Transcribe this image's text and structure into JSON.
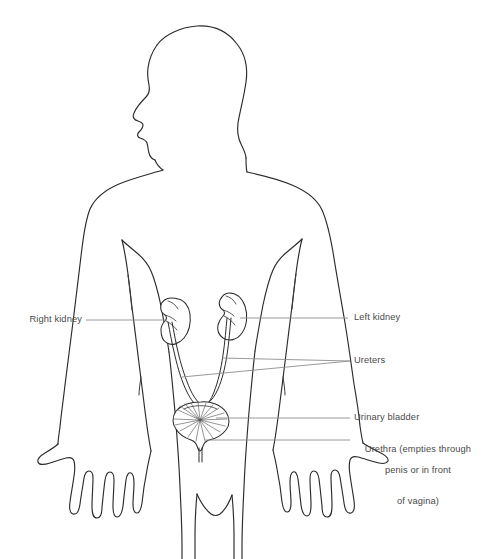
{
  "figure": {
    "type": "anatomical-line-diagram",
    "background_color": "#ffffff",
    "line_color": "#2b2b2b",
    "leader_color": "#8d8d8d",
    "text_color": "#4a4a4a"
  },
  "labels": {
    "right_kidney": "Right kidney",
    "left_kidney": "Left kidney",
    "ureters": "Ureters",
    "urinary_bladder": "Urinary bladder",
    "urethra_line1": "Urethra (empties through",
    "urethra_line2": "penis or in front",
    "urethra_line3": "of vagina)"
  },
  "structures": [
    {
      "name": "right-kidney",
      "side": "left-of-image",
      "label_key": "right_kidney"
    },
    {
      "name": "left-kidney",
      "side": "right-of-image",
      "label_key": "left_kidney"
    },
    {
      "name": "ureters",
      "count": 2,
      "label_key": "ureters"
    },
    {
      "name": "urinary-bladder",
      "count": 1,
      "label_key": "urinary_bladder"
    },
    {
      "name": "urethra",
      "count": 1,
      "label_key": "urethra_line1"
    }
  ],
  "body": {
    "figure_pose": "standing, front view, head in profile facing left, arms at sides with palms forward, fingers splayed",
    "visible_parts": [
      "head",
      "neck",
      "shoulders",
      "torso",
      "arms",
      "hands",
      "upper legs"
    ],
    "cropped_at_bottom": true
  }
}
